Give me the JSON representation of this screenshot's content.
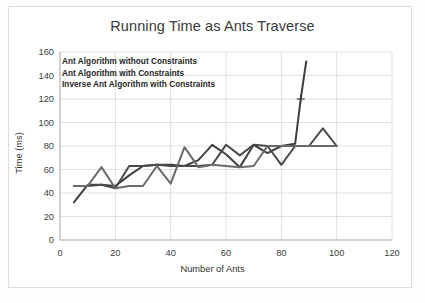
{
  "chart_data": {
    "type": "line",
    "title": "Running Time as Ants Traverse",
    "xlabel": "Number of Ants",
    "ylabel": "Time (ms)",
    "xlim": [
      0,
      120
    ],
    "ylim": [
      0,
      160
    ],
    "xticks": [
      0,
      20,
      40,
      60,
      80,
      100,
      120
    ],
    "yticks": [
      0,
      20,
      40,
      60,
      80,
      100,
      120,
      140,
      160
    ],
    "grid": true,
    "legend_position": "inside-top-left",
    "legend": [
      "Ant Algorithm without Constraints",
      "Ant Algorithm with Constraints",
      "Inverse Ant Algorithm with Constraints"
    ],
    "annotations": [
      {
        "label": "cross-marker",
        "x": 87,
        "y": 120
      }
    ],
    "series": [
      {
        "name": "Ant Algorithm without Constraints",
        "color": "#3f3f3f",
        "width": 2.0,
        "x": [
          5,
          10,
          15,
          20,
          25,
          30,
          35,
          40,
          45,
          50,
          55,
          60,
          65,
          70,
          75,
          80,
          85,
          87,
          89
        ],
        "y": [
          32,
          47,
          47,
          46,
          55,
          63,
          64,
          64,
          63,
          68,
          81,
          73,
          62,
          81,
          74,
          80,
          82,
          120,
          152
        ]
      },
      {
        "name": "Ant Algorithm with Constraints",
        "color": "#4a4a4a",
        "width": 2.0,
        "x": [
          5,
          10,
          15,
          20,
          25,
          30,
          35,
          40,
          45,
          50,
          55,
          60,
          65,
          70,
          75,
          80,
          85,
          90,
          95,
          100
        ],
        "y": [
          46,
          46,
          47,
          44,
          63,
          63,
          64,
          63,
          63,
          63,
          64,
          81,
          72,
          81,
          80,
          64,
          80,
          80,
          95,
          80
        ]
      },
      {
        "name": "Inverse Ant Algorithm with Constraints",
        "color": "#6a6a6a",
        "width": 2.0,
        "x": [
          5,
          10,
          15,
          20,
          25,
          30,
          35,
          40,
          45,
          50,
          55,
          60,
          65,
          70,
          75,
          80,
          85,
          90,
          95,
          100
        ],
        "y": [
          46,
          46,
          62,
          44,
          46,
          46,
          63,
          48,
          79,
          62,
          64,
          63,
          62,
          63,
          80,
          80,
          80,
          80,
          80,
          80
        ]
      }
    ]
  },
  "chart": {
    "title": "Running Time as Ants Traverse",
    "xlabel": "Number of Ants",
    "ylabel": "Time (ms)",
    "xticks": [
      "0",
      "20",
      "40",
      "60",
      "80",
      "100",
      "120"
    ],
    "yticks": [
      "160",
      "140",
      "120",
      "100",
      "80",
      "60",
      "40",
      "20",
      "0"
    ],
    "legend": {
      "line1": "Ant Algorithm without Constraints",
      "line2": "Ant Algorithm with Constraints",
      "line3": "Inverse Ant Algorithm with Constraints"
    }
  }
}
